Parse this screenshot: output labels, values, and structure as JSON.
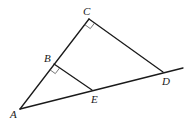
{
  "figure": {
    "type": "geometry",
    "points": {
      "A": {
        "label": "A"
      },
      "B": {
        "label": "B"
      },
      "C": {
        "label": "C"
      },
      "D": {
        "label": "D"
      },
      "E": {
        "label": "E"
      }
    },
    "segments": [
      "AC",
      "CD",
      "BE",
      "AD extended beyond D"
    ],
    "right_angles": [
      "ACD at C",
      "ABE at B"
    ]
  }
}
